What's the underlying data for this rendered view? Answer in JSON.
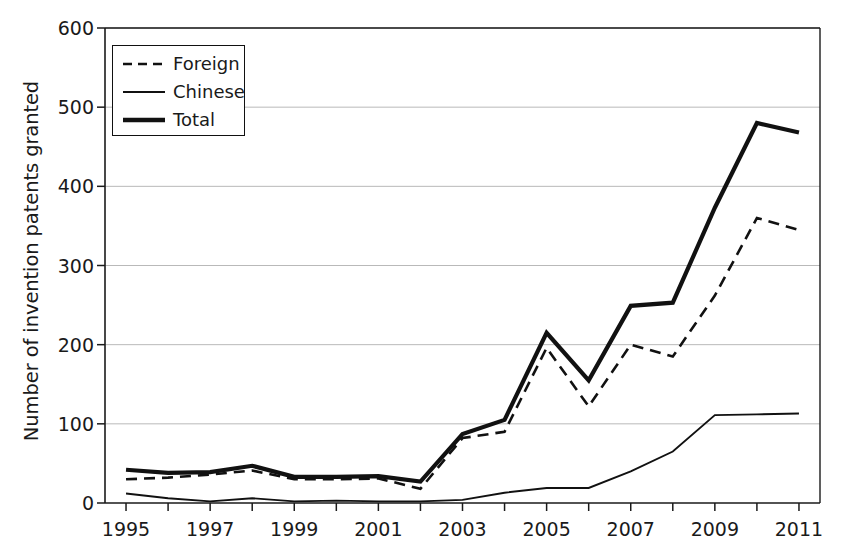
{
  "chart_data": {
    "type": "line",
    "title": "",
    "xlabel": "",
    "ylabel": "Number of invention patents granted",
    "x": [
      1995,
      1996,
      1997,
      1998,
      1999,
      2000,
      2001,
      2002,
      2003,
      2004,
      2005,
      2006,
      2007,
      2008,
      2009,
      2010,
      2011
    ],
    "xtick_labels": [
      "1995",
      "1997",
      "1999",
      "2001",
      "2003",
      "2005",
      "2007",
      "2009",
      "2011"
    ],
    "xtick_values": [
      1995,
      1997,
      1999,
      2001,
      2003,
      2005,
      2007,
      2009,
      2011
    ],
    "ytick_labels": [
      "0",
      "100",
      "200",
      "300",
      "400",
      "500",
      "600"
    ],
    "ytick_values": [
      0,
      100,
      200,
      300,
      400,
      500,
      600
    ],
    "xlim": [
      1994.5,
      2011.5
    ],
    "ylim": [
      0,
      600
    ],
    "grid": "horizontal",
    "legend_position": "top-left",
    "series": [
      {
        "name": "Foreign",
        "style": "dashed",
        "color": "#111111",
        "values": [
          30,
          32,
          36,
          41,
          30,
          30,
          31,
          18,
          82,
          90,
          196,
          122,
          200,
          185,
          262,
          360,
          345
        ]
      },
      {
        "name": "Chinese",
        "style": "thin-solid",
        "color": "#111111",
        "values": [
          12,
          6,
          2,
          6,
          2,
          3,
          2,
          2,
          4,
          13,
          19,
          19,
          40,
          65,
          111,
          112,
          113
        ]
      },
      {
        "name": "Total",
        "style": "thick-solid",
        "color": "#111111",
        "values": [
          42,
          38,
          39,
          47,
          33,
          33,
          34,
          27,
          87,
          105,
          215,
          155,
          249,
          253,
          373,
          480,
          468
        ]
      }
    ]
  },
  "legend": {
    "items": [
      {
        "label": "Foreign",
        "swatch": "dashed-line-swatch"
      },
      {
        "label": "Chinese",
        "swatch": "thin-line-swatch"
      },
      {
        "label": "Total",
        "swatch": "thick-line-swatch"
      }
    ]
  },
  "axes": {
    "y_title": "Number of invention patents granted"
  }
}
